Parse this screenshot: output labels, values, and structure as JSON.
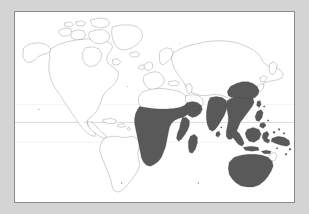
{
  "figure": {
    "kind": "world-distribution-map",
    "background_color": "#d4d4d4",
    "panel_color": "#ffffff",
    "panel_border_color": "#8a8a8a",
    "coastline_color": "#555555",
    "range_fill_color": "#595959",
    "equator_line_color": "#9a9a9a",
    "tropic_line_color": "#dcdcdc",
    "title": "",
    "caption": "",
    "legend_text": "",
    "axis_labels": []
  },
  "map": {
    "projection_note": "equirectangular",
    "graticule": {
      "equator_label": "",
      "tropic_of_cancer_label": "",
      "tropic_of_capricorn_label": "",
      "lines_visible": 3
    },
    "shaded_regions": [
      "sub-Saharan Africa",
      "Madagascar",
      "southern Arabian Peninsula",
      "Indian subcontinent",
      "Sri Lanka",
      "Southeast Asia",
      "southern China",
      "Taiwan",
      "Philippines",
      "Indonesia",
      "New Guinea",
      "Australia"
    ],
    "unshaded_regions": [
      "North America",
      "South America",
      "Europe",
      "northern Asia",
      "Sahara",
      "New Zealand",
      "Japan"
    ]
  }
}
